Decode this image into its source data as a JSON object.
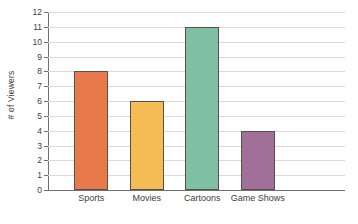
{
  "chart_data": {
    "type": "bar",
    "title": "",
    "subtitle": "",
    "xlabel": "",
    "ylabel": "# of Viewers",
    "categories": [
      "Sports",
      "Movies",
      "Cartoons",
      "Game Shows"
    ],
    "values": [
      8,
      6,
      11,
      4
    ],
    "ylim": [
      0,
      12
    ],
    "ytick_labels": [
      "0",
      "1",
      "2",
      "3",
      "4",
      "5",
      "6",
      "7",
      "8",
      "9",
      "10",
      "11",
      "12"
    ],
    "ytick_values": [
      0,
      1,
      2,
      3,
      4,
      5,
      6,
      7,
      8,
      9,
      10,
      11,
      12
    ],
    "grid": true,
    "legend": false,
    "legend_position": "none",
    "bar_colors": [
      "#e8794a",
      "#f5bb55",
      "#7fbfa4",
      "#a0709a"
    ],
    "bar_border_color": "#5a5046",
    "gridline_color": "#d9d9d9",
    "axis_color": "#6f6f6f",
    "background_color": "#ffffff",
    "text_color": "#3c3c3c"
  }
}
